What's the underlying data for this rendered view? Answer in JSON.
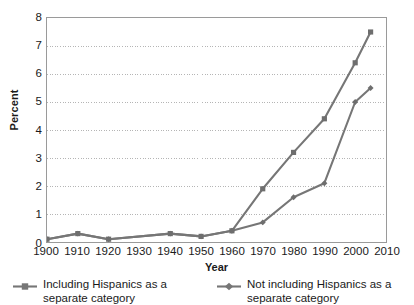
{
  "chart_data": {
    "type": "line",
    "title": "",
    "xlabel": "Year",
    "ylabel": "Percent",
    "xlim": [
      1900,
      2010
    ],
    "ylim": [
      0,
      8
    ],
    "ytick_labels": [
      "0",
      "1",
      "2",
      "3",
      "4",
      "5",
      "6",
      "7",
      "8"
    ],
    "ytick_values": [
      0,
      1,
      2,
      3,
      4,
      5,
      6,
      7,
      8
    ],
    "xtick_labels": [
      "1900",
      "1910",
      "1920",
      "1930",
      "1940",
      "1950",
      "1960",
      "1970",
      "1980",
      "1990",
      "2000",
      "2010"
    ],
    "xtick_values": [
      1900,
      1910,
      1920,
      1930,
      1940,
      1950,
      1960,
      1970,
      1980,
      1990,
      2000,
      2010
    ],
    "grid": "horizontal",
    "legend_position": "bottom",
    "series": [
      {
        "name": "Including Hispanics as a separate category",
        "marker": "square",
        "color": "#767676",
        "x": [
          1900,
          1910,
          1920,
          1940,
          1950,
          1960,
          1970,
          1980,
          1990,
          2000,
          2005
        ],
        "values": [
          0.1,
          0.3,
          0.1,
          0.3,
          0.2,
          0.4,
          1.9,
          3.2,
          4.4,
          6.4,
          7.5
        ]
      },
      {
        "name": "Not including Hispanics as a separate category",
        "marker": "diamond",
        "color": "#767676",
        "x": [
          1900,
          1910,
          1920,
          1940,
          1950,
          1960,
          1970,
          1980,
          1990,
          2000,
          2005
        ],
        "values": [
          0.1,
          0.3,
          0.1,
          0.3,
          0.2,
          0.4,
          0.7,
          1.6,
          2.1,
          5.0,
          5.5
        ]
      }
    ]
  },
  "legend": {
    "entries": [
      {
        "label": "Including Hispanics as a separate category",
        "marker": "square"
      },
      {
        "label": "Not including Hispanics as a separate category",
        "marker": "diamond"
      }
    ]
  },
  "axes": {
    "x_title": "Year",
    "y_title": "Percent"
  }
}
